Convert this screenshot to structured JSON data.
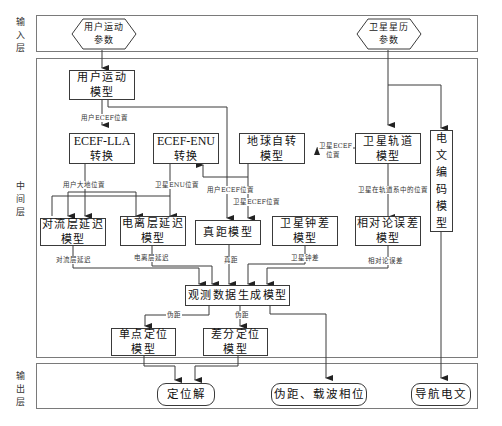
{
  "layers": {
    "input": {
      "label": "输入层"
    },
    "middle": {
      "label": "中间层"
    },
    "output": {
      "label": "输出层"
    }
  },
  "inputs": {
    "user_motion_params": {
      "line1": "用户运动",
      "line2": "参数"
    },
    "satellite_ephemeris_params": {
      "line1": "卫星星历",
      "line2": "参数"
    }
  },
  "models": {
    "user_motion": {
      "line1": "用户运动",
      "line2": "模型"
    },
    "ecef_lla": {
      "line1": "ECEF-LLA",
      "line2": "转换"
    },
    "ecef_enu": {
      "line1": "ECEF-ENU",
      "line2": "转换"
    },
    "earth_rotation": {
      "line1": "地球自转",
      "line2": "模型"
    },
    "satellite_orbit": {
      "line1": "卫星轨道",
      "line2": "模型"
    },
    "message_encoding": {
      "chars": [
        "电",
        "文",
        "编",
        "码",
        "模",
        "型"
      ]
    },
    "troposphere_delay": {
      "line1": "对流层延迟",
      "line2": "模型"
    },
    "ionosphere_delay": {
      "line1": "电离层延迟",
      "line2": "模型"
    },
    "true_range": {
      "line1": "真距模型"
    },
    "satellite_clock": {
      "line1": "卫星钟差",
      "line2": "模型"
    },
    "relativity_error": {
      "line1": "相对论误差",
      "line2": "模型"
    },
    "observation_generation": {
      "line1": "观测数据生成模型"
    },
    "single_point_positioning": {
      "line1": "单点定位",
      "line2": "模型"
    },
    "differential_positioning": {
      "line1": "差分定位",
      "line2": "模型"
    }
  },
  "outputs": {
    "position_solution": "定位解",
    "pseudorange_carrier_phase": "伪距、载波相位",
    "navigation_message": "导航电文"
  },
  "edge_labels": {
    "user_ecef_position": "用户ECEF位置",
    "user_geodetic_position": "用户大地位置",
    "satellite_enu_position": "卫星ENU位置",
    "satellite_ecef_position_a": "卫星ECEF",
    "satellite_ecef_position_b": "位置",
    "user_ecef_position_2": "用户ECEF位置",
    "satellite_ecef_position_2": "卫星ECEF位置",
    "satellite_orbit_position": "卫星在轨道系中的位置",
    "troposphere_delay": "对流层延迟",
    "ionosphere_delay": "电离层延迟",
    "true_range": "真距",
    "satellite_clock_bias": "卫星钟差",
    "relativity_error": "相对论误差",
    "pseudorange_1": "伪距",
    "pseudorange_2": "伪距"
  },
  "colors": {
    "line": "#3a3a3a",
    "frame": "#7a7a7a",
    "text": "#111111"
  }
}
